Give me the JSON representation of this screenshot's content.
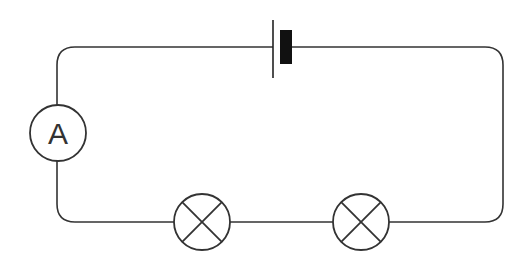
{
  "diagram": {
    "type": "series circuit",
    "canvas": {
      "width": 521,
      "height": 276
    },
    "colors": {
      "wire": "#333333",
      "background": "#ffffff",
      "cell_plate": "#111111"
    },
    "loop": {
      "left": 57,
      "top": 47,
      "right": 503,
      "bottom": 222,
      "corner_radius": 18
    },
    "components": [
      {
        "id": "cell",
        "kind": "battery-cell",
        "x": 273,
        "y": 47,
        "thin_plate_x": 273,
        "thick_plate_x": 280,
        "thick_plate_width": 12
      },
      {
        "id": "ammeter",
        "kind": "ammeter",
        "label": "A",
        "cx": 58,
        "cy": 133,
        "r": 28
      },
      {
        "id": "lamp-1",
        "kind": "lamp",
        "cx": 202,
        "cy": 222,
        "r": 28
      },
      {
        "id": "lamp-2",
        "kind": "lamp",
        "cx": 361,
        "cy": 222,
        "r": 28
      }
    ]
  },
  "ammeter": {
    "label": "A"
  }
}
